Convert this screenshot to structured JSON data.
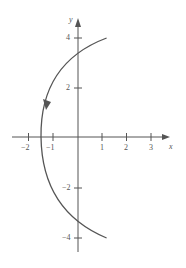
{
  "figure": {
    "axis_labels": {
      "x": "x",
      "y": "y"
    },
    "x_ticks": [
      {
        "value": -2,
        "label": "−2"
      },
      {
        "value": -1,
        "label": "−1"
      },
      {
        "value": 1,
        "label": "1"
      },
      {
        "value": 2,
        "label": "2"
      },
      {
        "value": 3,
        "label": "3"
      }
    ],
    "y_ticks": [
      {
        "value": 4,
        "label": "4"
      },
      {
        "value": 2,
        "label": "2"
      },
      {
        "value": -2,
        "label": "−2"
      },
      {
        "value": -4,
        "label": "−4"
      }
    ],
    "curve": {
      "description": "Parabola opening right, x = (y^2 - 9)/6, traced from (1.17, 4) to (1.17, -4) with a direction arrow pointing down along the upper branch",
      "vertex": [
        -1.5,
        0
      ],
      "y_intercepts": [
        3,
        -3
      ],
      "direction": "downward"
    },
    "colors": {
      "axis": "#555555",
      "curve": "#555555",
      "background": "#ffffff"
    }
  }
}
